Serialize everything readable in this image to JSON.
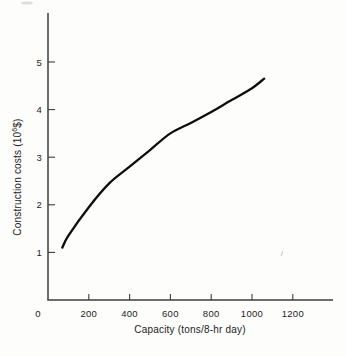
{
  "figure": {
    "background": "#fdfdfc",
    "curve_color": "#0d0d0d",
    "axis_color": "#3d3d3d",
    "label_color": "#1c1c1c",
    "artifact_color": "#d4d4d0"
  },
  "chart_data": {
    "type": "line",
    "title": "",
    "xlabel": "Capacity (tons/8-hr day)",
    "ylabel": "Construction costs (10^6 $)",
    "ylabel_parts": {
      "prefix": "Construction costs (10",
      "sup": "6",
      "suffix": "$)"
    },
    "x_ticks": [
      0,
      200,
      400,
      600,
      800,
      1000,
      1200
    ],
    "y_ticks": [
      1,
      2,
      3,
      4,
      5
    ],
    "xlim": [
      0,
      1400
    ],
    "ylim": [
      0,
      6
    ],
    "grid": false,
    "legend": false,
    "series": [
      {
        "name": "construction-cost-curve",
        "points": [
          [
            70,
            1.1
          ],
          [
            100,
            1.35
          ],
          [
            200,
            1.95
          ],
          [
            300,
            2.45
          ],
          [
            400,
            2.8
          ],
          [
            500,
            3.15
          ],
          [
            600,
            3.5
          ],
          [
            700,
            3.72
          ],
          [
            800,
            3.95
          ],
          [
            900,
            4.2
          ],
          [
            1000,
            4.45
          ],
          [
            1060,
            4.65
          ]
        ]
      }
    ]
  }
}
